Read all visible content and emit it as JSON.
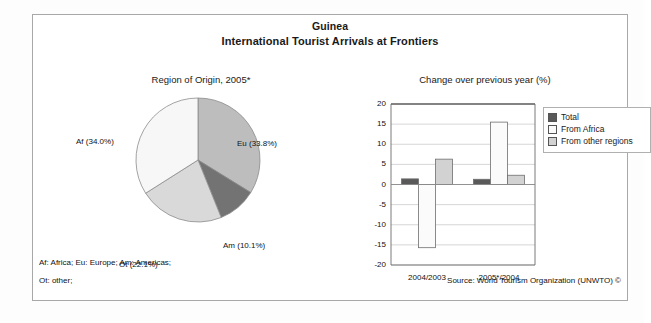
{
  "header": {
    "country": "Guinea",
    "subject": "International Tourist Arrivals at Frontiers"
  },
  "pie_panel": {
    "subtitle": "Region of Origin, 2005*"
  },
  "bar_panel": {
    "subtitle": "Change over previous year (%)"
  },
  "footnotes": {
    "line1": "Af: Africa; Eu: Europe; Am: Americas;",
    "line2": "Ot: other;",
    "source": "Source: World Tourism Organization (UNWTO) ©"
  },
  "legend": {
    "items": [
      {
        "label": "Total",
        "color": "#595959"
      },
      {
        "label": "From Africa",
        "color": "#fbfbfb"
      },
      {
        "label": "From other regions",
        "color": "#d2d2d2"
      }
    ]
  },
  "chart_data": [
    {
      "type": "pie",
      "title": "Region of Origin, 2005*",
      "legend_position": "labels-outside",
      "categories": [
        "Eu",
        "Am",
        "Ot",
        "Af"
      ],
      "labels": [
        "Eu (33.8%)",
        "Am (10.1%)",
        "Ot (22.1%)",
        "Af (34.0%)"
      ],
      "values": [
        33.8,
        10.1,
        22.1,
        34.0
      ],
      "colors": [
        "#bdbdbd",
        "#737373",
        "#d9d9d9",
        "#f7f7f7"
      ],
      "units": "percent"
    },
    {
      "type": "bar",
      "title": "Change over previous year (%)",
      "xlabel": "",
      "ylabel": "",
      "ylim": [
        -20,
        20
      ],
      "yticks": [
        20,
        15,
        10,
        5,
        0,
        -5,
        -10,
        -15,
        -20
      ],
      "grid": true,
      "legend_position": "right",
      "categories": [
        "2004/2003",
        "2005*/2004"
      ],
      "series": [
        {
          "name": "Total",
          "values": [
            1.4,
            1.3
          ],
          "color": "#595959"
        },
        {
          "name": "From Africa",
          "values": [
            -15.7,
            15.5
          ],
          "color": "#fbfbfb"
        },
        {
          "name": "From other regions",
          "values": [
            6.3,
            2.3
          ],
          "color": "#d2d2d2"
        }
      ]
    }
  ]
}
